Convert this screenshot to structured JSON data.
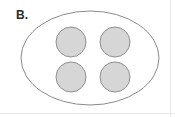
{
  "figure": {
    "panel_label": "B.",
    "caption": "",
    "background_color": "#ffffff"
  },
  "diagram": {
    "type": "schematic",
    "outline": {
      "name": "ellipse-outline",
      "shape": "ellipse",
      "center_x": 90,
      "center_y": 58,
      "radius_x": 69,
      "radius_y": 47,
      "stroke_color": "#8a8a8a",
      "stroke_width": 1,
      "fill_color": "none"
    },
    "circles": [
      {
        "name": "circle-top-left",
        "center_x": 71,
        "center_y": 42,
        "radius": 15,
        "fill_color": "#d6d6d6",
        "stroke_color": "#8f8f8f",
        "stroke_width": 1
      },
      {
        "name": "circle-top-right",
        "center_x": 115,
        "center_y": 42,
        "radius": 15,
        "fill_color": "#d6d6d6",
        "stroke_color": "#8f8f8f",
        "stroke_width": 1
      },
      {
        "name": "circle-bottom-left",
        "center_x": 71,
        "center_y": 77,
        "radius": 15,
        "fill_color": "#d6d6d6",
        "stroke_color": "#8f8f8f",
        "stroke_width": 1
      },
      {
        "name": "circle-bottom-right",
        "center_x": 115,
        "center_y": 77,
        "radius": 15,
        "fill_color": "#d6d6d6",
        "stroke_color": "#8f8f8f",
        "stroke_width": 1
      }
    ],
    "circle_count": 4,
    "rule_color": "#e8e8e8"
  }
}
